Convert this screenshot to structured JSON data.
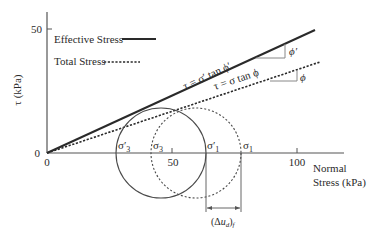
{
  "diagram": {
    "y_axis": {
      "label": "τ (kPa)",
      "ticks": [
        {
          "value": 0,
          "label": "0"
        },
        {
          "value": 50,
          "label": "50"
        }
      ]
    },
    "x_axis": {
      "label_line1": "Normal",
      "label_line2": "Stress (kPa)",
      "ticks": [
        {
          "value": 0,
          "label": "0"
        },
        {
          "value": 50,
          "label": "50"
        },
        {
          "value": 100,
          "label": "100"
        }
      ]
    },
    "legend": {
      "effective": "Effective Stress",
      "total": "Total Stress"
    },
    "envelopes": {
      "effective_equation": "τ = σ′ tan ϕ′",
      "total_equation": "τ = σ tan ϕ",
      "effective_angle_label": "ϕ′",
      "total_angle_label": "ϕ"
    },
    "circle_labels": {
      "sigma3_eff": "σ′3",
      "sigma3_tot": "σ3",
      "sigma1_eff": "σ′1",
      "sigma1_tot": "σ1"
    },
    "pore_pressure_label": "(Δud)f",
    "values_kpa": {
      "sigma3_eff": 27.5,
      "sigma1_eff": 63.5,
      "sigma3_tot": 41.5,
      "sigma1_tot": 77.5,
      "delta_u_f": 14
    },
    "colors": {
      "line": "#2a2a2a",
      "axis": "#555555",
      "background": "#ffffff"
    }
  }
}
